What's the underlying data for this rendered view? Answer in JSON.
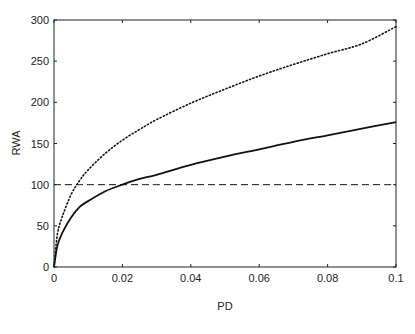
{
  "chart_data": {
    "type": "line",
    "title": "",
    "xlabel": "PD",
    "ylabel": "RWA",
    "xlim": [
      0,
      0.1
    ],
    "ylim": [
      0,
      300
    ],
    "grid": false,
    "legend": null,
    "xticks": [
      0,
      0.02,
      0.04,
      0.06,
      0.08,
      0.1
    ],
    "xtick_labels": [
      "0",
      "0.02",
      "0.04",
      "0.06",
      "0.08",
      "0.1"
    ],
    "yticks": [
      0,
      50,
      100,
      150,
      200,
      250,
      300
    ],
    "ytick_labels": [
      "0",
      "50",
      "100",
      "150",
      "200",
      "250",
      "300"
    ],
    "x": [
      0,
      0.001,
      0.0025,
      0.005,
      0.0075,
      0.01,
      0.015,
      0.02,
      0.025,
      0.03,
      0.04,
      0.05,
      0.06,
      0.07,
      0.08,
      0.09,
      0.1
    ],
    "series": [
      {
        "name": "dotted",
        "style": "dotted",
        "color": "#111111",
        "values": [
          0,
          40,
          62,
          88,
          105,
          118,
          138,
          154,
          167,
          179,
          199,
          216,
          232,
          246,
          259,
          271,
          292
        ]
      },
      {
        "name": "solid",
        "style": "solid",
        "color": "#111111",
        "values": [
          0,
          26,
          42,
          60,
          73,
          80,
          92,
          100,
          107,
          112,
          124,
          134,
          143,
          152,
          160,
          168,
          176
        ]
      },
      {
        "name": "dashed",
        "style": "dashed",
        "color": "#111111",
        "values": [
          100,
          100,
          100,
          100,
          100,
          100,
          100,
          100,
          100,
          100,
          100,
          100,
          100,
          100,
          100,
          100,
          100
        ]
      }
    ]
  }
}
